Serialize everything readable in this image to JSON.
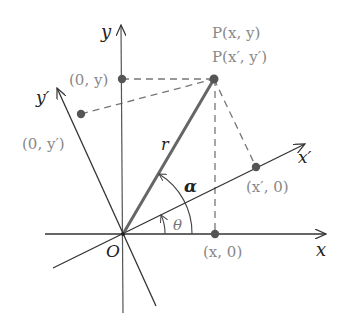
{
  "diagram": {
    "axes": {
      "x_label": "x",
      "y_label": "y",
      "x_prime_label": "x′",
      "y_prime_label": "y′",
      "origin_label": "O"
    },
    "point": {
      "label_original": "P(x, y)",
      "label_rotated": "P(x′, y′)",
      "radius_label": "r"
    },
    "projections": {
      "on_x": "(x, 0)",
      "on_y": "(0, y)",
      "on_x_prime": "(x′, 0)",
      "on_y_prime": "(0, y′)"
    },
    "angles": {
      "theta": "θ",
      "alpha": "α"
    },
    "colors": {
      "axis": "#333333",
      "radius": "#666666",
      "dashed": "#777777",
      "label_grey": "#888888",
      "point": "#555555"
    }
  }
}
